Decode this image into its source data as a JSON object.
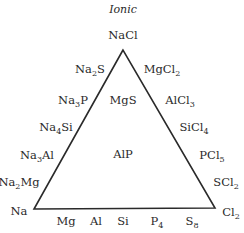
{
  "diagram": {
    "title": "Ionic",
    "apex": {
      "base": "NaCl"
    },
    "left_edge": [
      {
        "parts": [
          "Na",
          "2",
          "S"
        ]
      },
      {
        "parts": [
          "Na",
          "3",
          "P"
        ]
      },
      {
        "parts": [
          "Na",
          "4",
          "Si"
        ]
      },
      {
        "parts": [
          "Na",
          "3",
          "Al"
        ]
      },
      {
        "parts": [
          "Na",
          "2",
          "Mg"
        ]
      }
    ],
    "right_edge": [
      {
        "parts": [
          "MgCl",
          "2",
          ""
        ]
      },
      {
        "parts": [
          "AlCl",
          "3",
          ""
        ]
      },
      {
        "parts": [
          "SiCl",
          "4",
          ""
        ]
      },
      {
        "parts": [
          "PCl",
          "5",
          ""
        ]
      },
      {
        "parts": [
          "SCl",
          "2",
          ""
        ]
      }
    ],
    "inside": [
      {
        "text": "MgS"
      },
      {
        "text": "AlP"
      }
    ],
    "corners": {
      "left": {
        "text": "Na"
      },
      "right": {
        "parts": [
          "Cl",
          "2",
          ""
        ]
      }
    },
    "bottom_edge": [
      {
        "parts": [
          "Mg",
          "",
          ""
        ]
      },
      {
        "parts": [
          "Al",
          "",
          ""
        ]
      },
      {
        "parts": [
          "Si",
          "",
          ""
        ]
      },
      {
        "parts": [
          "P",
          "4",
          ""
        ]
      },
      {
        "parts": [
          "S",
          "8",
          ""
        ]
      }
    ]
  }
}
